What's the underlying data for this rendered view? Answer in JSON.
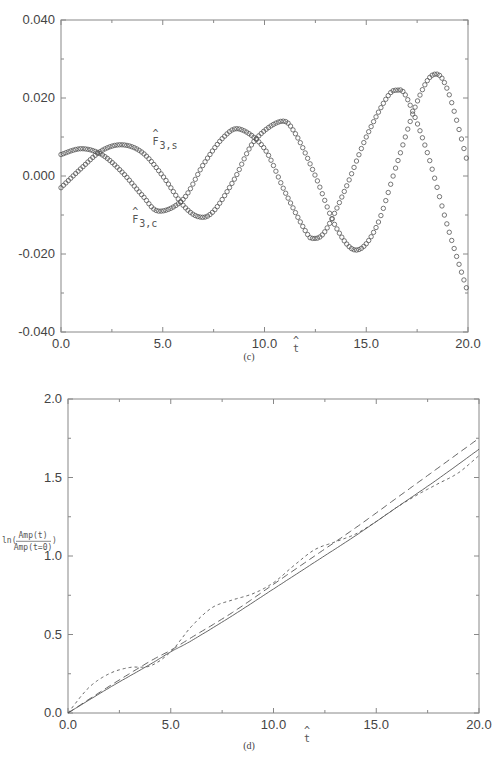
{
  "chart_data": [
    {
      "id": "c",
      "type": "scatter",
      "caption": "(c)",
      "xlabel": "t̂",
      "ylabel": "",
      "xlim": [
        0.0,
        20.0
      ],
      "ylim": [
        -0.04,
        0.04
      ],
      "xticks": [
        "0.0",
        "5.0",
        "10.0",
        "15.0",
        "20.0"
      ],
      "yticks": [
        "-0.040",
        "-0.020",
        "0.000",
        "0.020",
        "0.040"
      ],
      "grid": false,
      "legend": "inline labels",
      "marker": "open circle",
      "series": [
        {
          "name": "F̂3,s",
          "label_base": "F",
          "label_sub": "3,s",
          "x": [
            0,
            1,
            2,
            3,
            4,
            4.8,
            6,
            7,
            8,
            8.8,
            10,
            11,
            12,
            12.4,
            13,
            14,
            15,
            16,
            16.5,
            17,
            18,
            19,
            20
          ],
          "y": [
            0.0055,
            0.007,
            0.0055,
            0.001,
            -0.005,
            -0.009,
            -0.006,
            0.003,
            0.01,
            0.012,
            0.007,
            -0.004,
            -0.014,
            -0.016,
            -0.014,
            -0.003,
            0.01,
            0.02,
            0.022,
            0.02,
            0.006,
            -0.013,
            -0.03
          ]
        },
        {
          "name": "F̂3,c",
          "label_base": "F",
          "label_sub": "3,c",
          "x": [
            0,
            1,
            2,
            3,
            4,
            5,
            6,
            6.8,
            7.5,
            8.5,
            9.5,
            10.8,
            11.5,
            12.5,
            13.5,
            14.5,
            15.5,
            16.5,
            17.5,
            18.3,
            19,
            20
          ],
          "y": [
            -0.003,
            0.002,
            0.0065,
            0.008,
            0.006,
            0.0,
            -0.0075,
            -0.0105,
            -0.009,
            -0.001,
            0.009,
            0.014,
            0.011,
            0.0,
            -0.013,
            -0.019,
            -0.013,
            0.003,
            0.019,
            0.026,
            0.022,
            0.003
          ]
        }
      ],
      "annotations": [
        {
          "text": "F̂3,s",
          "x": 4.5,
          "y": 0.008
        },
        {
          "text": "F̂3,c",
          "x": 3.5,
          "y": -0.012
        }
      ]
    },
    {
      "id": "d",
      "type": "line",
      "caption": "(d)",
      "xlabel": "t̂",
      "ylabel": "ln(Amp(t)/Amp(t=0))",
      "ylabel_fn": "ln(",
      "ylabel_num": "Amp(t)",
      "ylabel_den": "Amp(t=0)",
      "ylabel_close": ")",
      "xlim": [
        0.0,
        20.0
      ],
      "ylim": [
        0.0,
        2.0
      ],
      "xticks": [
        "0.0",
        "5.0",
        "10.0",
        "15.0",
        "20.0"
      ],
      "yticks": [
        "0.0",
        "0.5",
        "1.0",
        "1.5",
        "2.0"
      ],
      "grid": false,
      "series": [
        {
          "name": "solid",
          "style": "solid",
          "x": [
            0,
            2,
            4,
            5,
            6,
            8,
            10,
            12,
            14,
            16,
            18,
            20
          ],
          "y": [
            0.0,
            0.16,
            0.31,
            0.39,
            0.46,
            0.62,
            0.79,
            0.96,
            1.13,
            1.31,
            1.49,
            1.68
          ]
        },
        {
          "name": "long-dashed",
          "style": "dashed",
          "x": [
            0,
            2,
            4,
            5,
            6,
            8,
            10,
            12,
            14,
            16,
            18,
            20
          ],
          "y": [
            0.0,
            0.17,
            0.33,
            0.4,
            0.48,
            0.64,
            0.82,
            1.0,
            1.18,
            1.37,
            1.56,
            1.75
          ]
        },
        {
          "name": "short-dashed",
          "style": "dotted",
          "x": [
            0,
            1,
            2,
            3,
            4,
            5,
            6,
            7,
            8,
            9,
            10,
            11,
            12,
            13,
            14,
            15,
            16,
            17,
            18,
            19,
            20
          ],
          "y": [
            0.0,
            0.16,
            0.25,
            0.29,
            0.3,
            0.39,
            0.55,
            0.67,
            0.72,
            0.76,
            0.83,
            0.94,
            1.04,
            1.09,
            1.14,
            1.22,
            1.31,
            1.39,
            1.46,
            1.53,
            1.64
          ]
        }
      ]
    }
  ]
}
